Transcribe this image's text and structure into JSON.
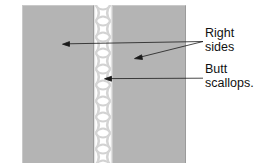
{
  "figure": {
    "name": "butted-scallop-seam-diagram",
    "background_color": "#ffffff",
    "width": 266,
    "height": 166
  },
  "panels": [
    {
      "id": "panel-left",
      "label": "left fabric panel",
      "fill_color": "#b4b4b4",
      "edge_highlight_color": "#c9c9c9",
      "edge_shadow_color": "#9b9b9b"
    },
    {
      "id": "panel-right",
      "label": "right fabric panel",
      "fill_color": "#b4b4b4",
      "edge_highlight_color": "#c9c9c9",
      "edge_shadow_color": "#9b9b9b"
    }
  ],
  "scallop_strip": {
    "label": "butted scallop lace strip",
    "pattern": "x-hourglass-repeat",
    "pattern_color": "#d0d0d0",
    "background_color": "#ffffff",
    "repeat_height_px": 16
  },
  "callouts": [
    {
      "id": "right-sides",
      "text": "Right\nsides",
      "line1": "Right",
      "line2": "sides",
      "text_color": "#111111",
      "leader_color": "#1a1a1a",
      "pointers": 2
    },
    {
      "id": "butt-scallops",
      "text": "Butt\nscallops.",
      "line1": "Butt",
      "line2": "scallops.",
      "text_color": "#111111",
      "leader_color": "#1a1a1a",
      "pointers": 1
    }
  ]
}
